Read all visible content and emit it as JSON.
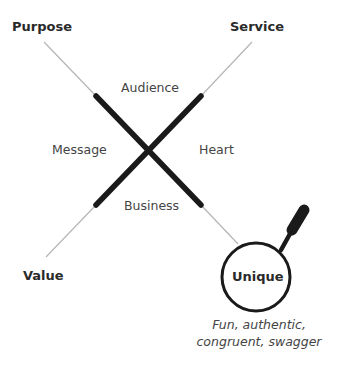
{
  "corners": {
    "top_left": "Purpose",
    "top_right": "Service",
    "bottom_left": "Value"
  },
  "inner": {
    "top": "Audience",
    "left": "Message",
    "right": "Heart",
    "bottom": "Business"
  },
  "focus": {
    "label": "Unique",
    "caption_line1": "Fun, authentic,",
    "caption_line2": "congruent, swagger"
  },
  "colors": {
    "thick_line": "#1a1a1a",
    "thin_line": "#b5b5b5",
    "text": "#333333"
  }
}
